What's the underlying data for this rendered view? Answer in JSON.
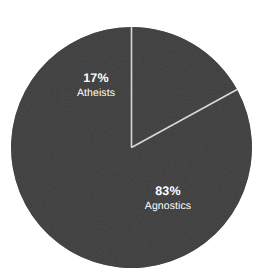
{
  "chart_data": {
    "type": "pie",
    "title": "",
    "subtitle": "",
    "xlabel": "",
    "ylabel": "",
    "legend_position": "none",
    "grid": false,
    "labels_inside_slices": true,
    "start_angle_deg": 0,
    "direction": "counterclockwise",
    "categories": [
      "Agnostics",
      "Atheists"
    ],
    "values": [
      83,
      17
    ],
    "units": "percent",
    "slices": [
      {
        "name": "Agnostics",
        "value": 83,
        "value_label": "83%",
        "angle_deg": 298.8,
        "color": "#3d3d3d",
        "label_color": "#ffffff"
      },
      {
        "name": "Atheists",
        "value": 17,
        "value_label": "17%",
        "angle_deg": 61.2,
        "color": "#3d3d3d",
        "label_color": "#ffffff"
      }
    ]
  },
  "colors": {
    "background": "#ffffff",
    "pie_fill": "#3d3d3d",
    "divider": "#d8d8d8",
    "label_text": "#ffffff"
  },
  "geometry": {
    "center_x": 131.5,
    "center_y": 147.5,
    "radius": 120.5,
    "divider_width": 1.6
  }
}
